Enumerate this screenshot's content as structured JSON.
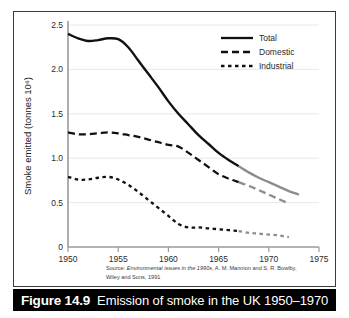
{
  "figure": {
    "caption_number": "Figure 14.9",
    "caption_text": "Emission of smoke in the UK 1950–1970",
    "source_line_1_prefix": "Source: ",
    "source_line_1_italic": "Environmental issues in the 1990s",
    "source_line_1_suffix": ", A. M. Mannion and S. R. Bowlby,",
    "source_line_2": "Wiley and Sons, 1991"
  },
  "chart_data": {
    "type": "line",
    "title": "",
    "xlabel": "",
    "ylabel": "Smoke emitted (tonnes 10⁶)",
    "xlim": [
      1950,
      1975
    ],
    "ylim": [
      0,
      2.5
    ],
    "xticks": [
      1950,
      1955,
      1960,
      1965,
      1970,
      1975
    ],
    "xticklabels": [
      "1950",
      "1955",
      "1960",
      "1965",
      "1970",
      "1975"
    ],
    "yticks": [
      0,
      0.5,
      1.0,
      1.5,
      2.0,
      2.5
    ],
    "yticklabels": [
      "0",
      "0.5",
      "1.0",
      "1.5",
      "2.0",
      "2.5"
    ],
    "grid": "horizontal",
    "legend_position": "top-right",
    "projection_starts_year": 1967,
    "projection_color": "#8c8c8c",
    "observed_color": "#111111",
    "series": [
      {
        "name": "Total",
        "style": "solid",
        "x": [
          1950,
          1951,
          1952,
          1953,
          1954,
          1955,
          1956,
          1957,
          1958,
          1959,
          1960,
          1961,
          1962,
          1963,
          1964,
          1965,
          1966,
          1967,
          1968,
          1969,
          1970,
          1971,
          1972,
          1973
        ],
        "values": [
          2.4,
          2.35,
          2.32,
          2.33,
          2.35,
          2.34,
          2.25,
          2.1,
          1.95,
          1.8,
          1.64,
          1.5,
          1.38,
          1.26,
          1.16,
          1.06,
          0.98,
          0.91,
          0.84,
          0.78,
          0.73,
          0.68,
          0.63,
          0.59
        ]
      },
      {
        "name": "Domestic",
        "style": "dashed",
        "x": [
          1950,
          1951,
          1952,
          1953,
          1954,
          1955,
          1956,
          1957,
          1958,
          1959,
          1960,
          1961,
          1962,
          1963,
          1964,
          1965,
          1966,
          1967,
          1968,
          1969,
          1970,
          1971,
          1972
        ],
        "values": [
          1.29,
          1.27,
          1.27,
          1.28,
          1.29,
          1.28,
          1.26,
          1.24,
          1.21,
          1.18,
          1.15,
          1.13,
          1.06,
          0.98,
          0.9,
          0.82,
          0.77,
          0.73,
          0.69,
          0.64,
          0.59,
          0.54,
          0.49
        ]
      },
      {
        "name": "Industrial",
        "style": "dotted",
        "x": [
          1950,
          1951,
          1952,
          1953,
          1954,
          1955,
          1956,
          1957,
          1958,
          1959,
          1960,
          1961,
          1962,
          1963,
          1964,
          1965,
          1966,
          1967,
          1968,
          1969,
          1970,
          1971,
          1972
        ],
        "values": [
          0.79,
          0.76,
          0.76,
          0.78,
          0.79,
          0.76,
          0.7,
          0.62,
          0.53,
          0.44,
          0.35,
          0.26,
          0.22,
          0.22,
          0.21,
          0.2,
          0.19,
          0.18,
          0.16,
          0.15,
          0.14,
          0.13,
          0.11
        ]
      }
    ],
    "legend": [
      {
        "label": "Total",
        "style": "solid"
      },
      {
        "label": "Domestic",
        "style": "dashed"
      },
      {
        "label": "Industrial",
        "style": "dotted"
      }
    ]
  }
}
